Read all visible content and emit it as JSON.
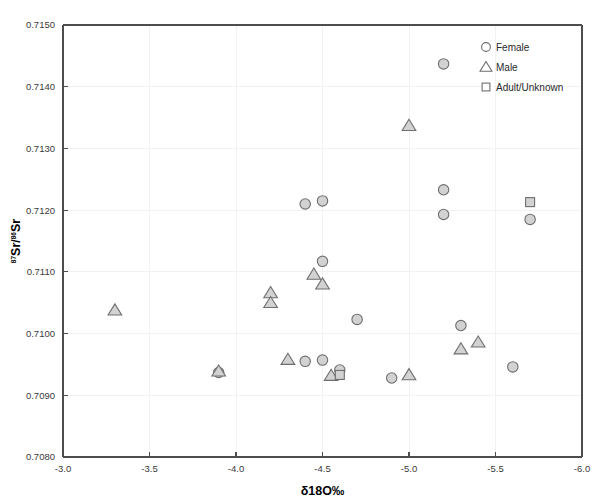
{
  "chart_data": {
    "type": "scatter",
    "title": "",
    "xlabel": "δ18O‰",
    "ylabel": "87Sr/86Sr",
    "xlim": [
      -3.0,
      -6.0
    ],
    "ylim": [
      0.708,
      0.715
    ],
    "x_ticks": [
      "-3.0",
      "-3.5",
      "-4.0",
      "-4.5",
      "-5.0",
      "-5.5",
      "-6.0"
    ],
    "x_tick_values": [
      -3.0,
      -3.5,
      -4.0,
      -4.5,
      -5.0,
      -5.5,
      -6.0
    ],
    "y_ticks": [
      "0.7080",
      "0.7090",
      "0.7100",
      "0.7110",
      "0.7120",
      "0.7130",
      "0.7140",
      "0.7150"
    ],
    "y_tick_values": [
      0.708,
      0.709,
      0.71,
      0.711,
      0.712,
      0.713,
      0.714,
      0.715
    ],
    "grid": true,
    "legend_position": "top-right",
    "x_axis_reversed": true,
    "series": [
      {
        "name": "Female",
        "marker": "circle",
        "points": [
          {
            "x": -5.2,
            "y": 0.71437
          },
          {
            "x": -5.2,
            "y": 0.71233
          },
          {
            "x": -5.2,
            "y": 0.71193
          },
          {
            "x": -4.5,
            "y": 0.71215
          },
          {
            "x": -4.4,
            "y": 0.7121
          },
          {
            "x": -5.7,
            "y": 0.71185
          },
          {
            "x": -4.5,
            "y": 0.71117
          },
          {
            "x": -4.7,
            "y": 0.71023
          },
          {
            "x": -5.3,
            "y": 0.71013
          },
          {
            "x": -5.6,
            "y": 0.70946
          },
          {
            "x": -4.4,
            "y": 0.70955
          },
          {
            "x": -4.5,
            "y": 0.70957
          },
          {
            "x": -4.6,
            "y": 0.70941
          },
          {
            "x": -4.9,
            "y": 0.70928
          },
          {
            "x": -3.9,
            "y": 0.70937
          }
        ]
      },
      {
        "name": "Male",
        "marker": "triangle",
        "points": [
          {
            "x": -5.0,
            "y": 0.71337
          },
          {
            "x": -4.45,
            "y": 0.71096
          },
          {
            "x": -4.5,
            "y": 0.7108
          },
          {
            "x": -4.2,
            "y": 0.71066
          },
          {
            "x": -4.2,
            "y": 0.7105
          },
          {
            "x": -3.3,
            "y": 0.71038
          },
          {
            "x": -4.3,
            "y": 0.70958
          },
          {
            "x": -5.4,
            "y": 0.70986
          },
          {
            "x": -5.3,
            "y": 0.70975
          },
          {
            "x": -5.0,
            "y": 0.70933
          },
          {
            "x": -4.55,
            "y": 0.70932
          },
          {
            "x": -3.9,
            "y": 0.70939
          }
        ]
      },
      {
        "name": "Adult/Unknown",
        "marker": "square",
        "points": [
          {
            "x": -5.7,
            "y": 0.71213
          },
          {
            "x": -4.6,
            "y": 0.70933
          }
        ]
      }
    ]
  },
  "legend": {
    "items": [
      {
        "label": "Female",
        "marker": "circle"
      },
      {
        "label": "Male",
        "marker": "triangle"
      },
      {
        "label": "Adult/Unknown",
        "marker": "square"
      }
    ]
  },
  "axes": {
    "x_title": "δ18O‰",
    "y_title_base": "Sr/",
    "y_sup1": "87",
    "y_sup2": "86",
    "y_title_tail": "Sr"
  }
}
